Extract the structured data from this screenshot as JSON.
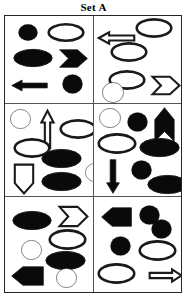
{
  "title": "Set A",
  "colors": {
    "fill_black": "#0a0a0a",
    "fill_white": "#ffffff",
    "stroke": "#1a1a1a",
    "frame": "#262626",
    "divider": "#555555"
  },
  "grid": {
    "rows": 3,
    "cols": 2,
    "cell_count": 6
  },
  "cells": [
    {
      "id": "cell-1",
      "position": "top-left",
      "shapes": [
        {
          "name": "circle-black",
          "kind": "circle",
          "fill": "black",
          "x": 13,
          "y": 8,
          "w": 20,
          "h": 17
        },
        {
          "name": "stadium-white",
          "kind": "stadium",
          "fill": "white",
          "x": 43,
          "y": 8,
          "w": 36,
          "h": 17
        },
        {
          "name": "stadium-black",
          "kind": "stadium",
          "fill": "black",
          "x": 8,
          "y": 33,
          "w": 40,
          "h": 18
        },
        {
          "name": "pennant-right-black",
          "kind": "pennant-right",
          "fill": "black",
          "x": 54,
          "y": 33,
          "w": 29,
          "h": 19
        },
        {
          "name": "arrow-left-black",
          "kind": "arrow-left",
          "fill": "black",
          "x": 6,
          "y": 61,
          "w": 37,
          "h": 17
        },
        {
          "name": "circle-black",
          "kind": "circle",
          "fill": "black",
          "x": 57,
          "y": 58,
          "w": 21,
          "h": 20
        }
      ]
    },
    {
      "id": "cell-2",
      "position": "top-right",
      "shapes": [
        {
          "name": "arrow-left-white",
          "kind": "arrow-left",
          "fill": "white",
          "x": 4,
          "y": 13,
          "w": 37,
          "h": 18
        },
        {
          "name": "stadium-white",
          "kind": "stadium",
          "fill": "white",
          "x": 42,
          "y": 3,
          "w": 36,
          "h": 18
        },
        {
          "name": "stadium-white",
          "kind": "stadium",
          "fill": "white",
          "x": 17,
          "y": 27,
          "w": 36,
          "h": 18
        },
        {
          "name": "stadium-white",
          "kind": "stadium",
          "fill": "white",
          "x": 15,
          "y": 55,
          "w": 36,
          "h": 18
        },
        {
          "name": "circle-white",
          "kind": "circle",
          "fill": "white",
          "x": 8,
          "y": 66,
          "w": 22,
          "h": 21
        },
        {
          "name": "pennant-right-white",
          "kind": "pennant-right",
          "fill": "white",
          "x": 58,
          "y": 60,
          "w": 28,
          "h": 19
        }
      ]
    },
    {
      "id": "cell-3",
      "position": "middle-left",
      "shapes": [
        {
          "name": "circle-white",
          "kind": "circle",
          "fill": "white",
          "x": 5,
          "y": 5,
          "w": 21,
          "h": 20
        },
        {
          "name": "arrow-up-white",
          "kind": "arrow-up",
          "fill": "white",
          "x": 33,
          "y": 6,
          "w": 19,
          "h": 39
        },
        {
          "name": "stadium-white",
          "kind": "stadium",
          "fill": "white",
          "x": 55,
          "y": 16,
          "w": 36,
          "h": 18
        },
        {
          "name": "stadium-white",
          "kind": "stadium",
          "fill": "white",
          "x": 9,
          "y": 35,
          "w": 36,
          "h": 18
        },
        {
          "name": "stadium-black",
          "kind": "stadium",
          "fill": "black",
          "x": 36,
          "y": 45,
          "w": 41,
          "h": 19
        },
        {
          "name": "pennant-down-white",
          "kind": "pennant-down",
          "fill": "white",
          "x": 9,
          "y": 60,
          "w": 20,
          "h": 30
        },
        {
          "name": "stadium-black",
          "kind": "stadium",
          "fill": "black",
          "x": 36,
          "y": 68,
          "w": 41,
          "h": 19
        },
        {
          "name": "circle-white",
          "kind": "circle",
          "fill": "white",
          "x": 80,
          "y": 59,
          "w": 20,
          "h": 19
        }
      ]
    },
    {
      "id": "cell-4",
      "position": "middle-right",
      "shapes": [
        {
          "name": "circle-white",
          "kind": "circle",
          "fill": "white",
          "x": 5,
          "y": 4,
          "w": 22,
          "h": 20
        },
        {
          "name": "circle-black",
          "kind": "circle",
          "fill": "black",
          "x": 33,
          "y": 8,
          "w": 21,
          "h": 20
        },
        {
          "name": "pennant-up-black",
          "kind": "pennant-up",
          "fill": "black",
          "x": 60,
          "y": 3,
          "w": 21,
          "h": 35
        },
        {
          "name": "stadium-white",
          "kind": "stadium",
          "fill": "white",
          "x": 4,
          "y": 30,
          "w": 38,
          "h": 19
        },
        {
          "name": "stadium-black",
          "kind": "stadium",
          "fill": "black",
          "x": 45,
          "y": 34,
          "w": 41,
          "h": 19
        },
        {
          "name": "arrow-down-black",
          "kind": "arrow-down",
          "fill": "black",
          "x": 9,
          "y": 55,
          "w": 20,
          "h": 35
        },
        {
          "name": "circle-black",
          "kind": "circle",
          "fill": "black",
          "x": 37,
          "y": 56,
          "w": 21,
          "h": 20
        },
        {
          "name": "stadium-black",
          "kind": "stadium",
          "fill": "black",
          "x": 53,
          "y": 71,
          "w": 41,
          "h": 19
        }
      ]
    },
    {
      "id": "cell-5",
      "position": "bottom-left",
      "shapes": [
        {
          "name": "stadium-black",
          "kind": "stadium",
          "fill": "black",
          "x": 7,
          "y": 14,
          "w": 40,
          "h": 19
        },
        {
          "name": "pennant-right-white",
          "kind": "pennant-right",
          "fill": "white",
          "x": 54,
          "y": 9,
          "w": 29,
          "h": 21
        },
        {
          "name": "circle-white",
          "kind": "circle",
          "fill": "white",
          "x": 16,
          "y": 43,
          "w": 21,
          "h": 20
        },
        {
          "name": "stadium-white",
          "kind": "stadium",
          "fill": "white",
          "x": 44,
          "y": 33,
          "w": 37,
          "h": 19
        },
        {
          "name": "stadium-black",
          "kind": "stadium",
          "fill": "black",
          "x": 40,
          "y": 54,
          "w": 41,
          "h": 19
        },
        {
          "name": "pennant-left-black",
          "kind": "pennant-left",
          "fill": "black",
          "x": 6,
          "y": 69,
          "w": 33,
          "h": 20
        },
        {
          "name": "circle-white",
          "kind": "circle",
          "fill": "white",
          "x": 51,
          "y": 71,
          "w": 21,
          "h": 20
        }
      ]
    },
    {
      "id": "cell-6",
      "position": "bottom-right",
      "shapes": [
        {
          "name": "pennant-left-black",
          "kind": "pennant-left",
          "fill": "black",
          "x": 7,
          "y": 10,
          "w": 31,
          "h": 20
        },
        {
          "name": "circle-black",
          "kind": "circle",
          "fill": "black",
          "x": 45,
          "y": 8,
          "w": 21,
          "h": 20
        },
        {
          "name": "circle-black",
          "kind": "circle",
          "fill": "black",
          "x": 57,
          "y": 22,
          "w": 21,
          "h": 20
        },
        {
          "name": "circle-black",
          "kind": "circle",
          "fill": "black",
          "x": 16,
          "y": 39,
          "w": 21,
          "h": 20
        },
        {
          "name": "stadium-white",
          "kind": "stadium",
          "fill": "white",
          "x": 45,
          "y": 44,
          "w": 37,
          "h": 19
        },
        {
          "name": "stadium-white",
          "kind": "stadium",
          "fill": "white",
          "x": 4,
          "y": 67,
          "w": 37,
          "h": 19
        },
        {
          "name": "arrow-right-white",
          "kind": "arrow-right",
          "fill": "white",
          "x": 55,
          "y": 69,
          "w": 33,
          "h": 19
        }
      ]
    }
  ]
}
